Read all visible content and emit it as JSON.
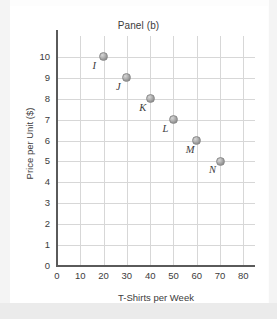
{
  "chart_data": {
    "type": "scatter",
    "title": "Panel (b)",
    "xlabel": "T-Shirts per Week",
    "ylabel": "Price per Unit ($)",
    "xlim": [
      0,
      85
    ],
    "ylim": [
      0,
      11
    ],
    "grid": true,
    "legend": "none",
    "xticks": [
      "0",
      "10",
      "20",
      "30",
      "40",
      "50",
      "60",
      "70",
      "80"
    ],
    "xtick_values": [
      0,
      10,
      20,
      30,
      40,
      50,
      60,
      70,
      80
    ],
    "yticks": [
      "0",
      "1",
      "2",
      "3",
      "4",
      "5",
      "6",
      "7",
      "8",
      "9",
      "10"
    ],
    "ytick_values": [
      0,
      1,
      2,
      3,
      4,
      5,
      6,
      7,
      8,
      9,
      10
    ],
    "point_labels": [
      "I",
      "J",
      "K",
      "L",
      "M",
      "N"
    ],
    "x": [
      20,
      30,
      40,
      50,
      60,
      70
    ],
    "y": [
      10,
      9,
      8,
      7,
      6,
      5
    ],
    "points": [
      {
        "label": "I",
        "x": 20,
        "y": 10
      },
      {
        "label": "J",
        "x": 30,
        "y": 9
      },
      {
        "label": "K",
        "x": 40,
        "y": 8
      },
      {
        "label": "L",
        "x": 50,
        "y": 7
      },
      {
        "label": "M",
        "x": 60,
        "y": 6
      },
      {
        "label": "N",
        "x": 70,
        "y": 5
      }
    ],
    "marker_color": "#9b9b9b",
    "grid_color": "#d7d7d7",
    "axis_color": "#5a5a5a",
    "text_color": "#3c3c3c",
    "background": "#ffffff"
  }
}
